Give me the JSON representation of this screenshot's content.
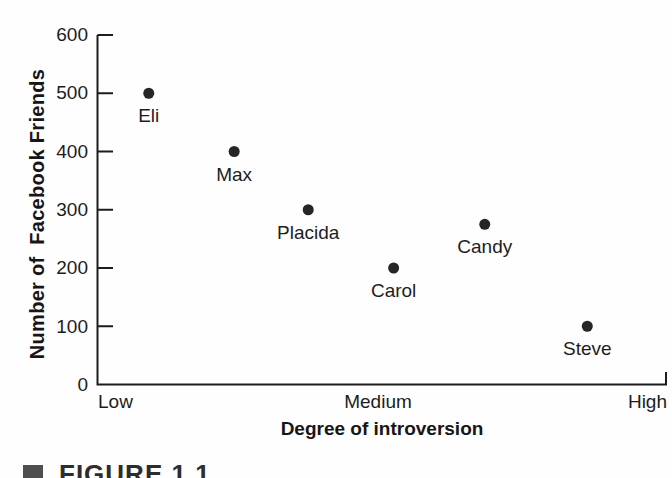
{
  "figure": {
    "caption": "FIGURE 1.1"
  },
  "colors": {
    "background": "#fefefe",
    "dot": "#262626",
    "axis": "#1c1c1c",
    "text": "#1d1d1d",
    "caption_bullet": "#4f4f4f"
  },
  "chart_data": {
    "type": "scatter",
    "title": "",
    "xlabel": "Degree of introversion",
    "ylabel": "Number of  Facebook Friends",
    "x_tick_labels": [
      "Low",
      "Medium",
      "High"
    ],
    "y_ticks": [
      0,
      100,
      200,
      300,
      400,
      500,
      600
    ],
    "ylim": [
      0,
      600
    ],
    "grid": false,
    "points": [
      {
        "name": "Eli",
        "facebook_friends": 500,
        "introversion_frac": 0.09
      },
      {
        "name": "Max",
        "facebook_friends": 400,
        "introversion_frac": 0.24
      },
      {
        "name": "Placida",
        "facebook_friends": 300,
        "introversion_frac": 0.37
      },
      {
        "name": "Carol",
        "facebook_friends": 200,
        "introversion_frac": 0.52
      },
      {
        "name": "Candy",
        "facebook_friends": 275,
        "introversion_frac": 0.68
      },
      {
        "name": "Steve",
        "facebook_friends": 100,
        "introversion_frac": 0.86
      }
    ]
  }
}
